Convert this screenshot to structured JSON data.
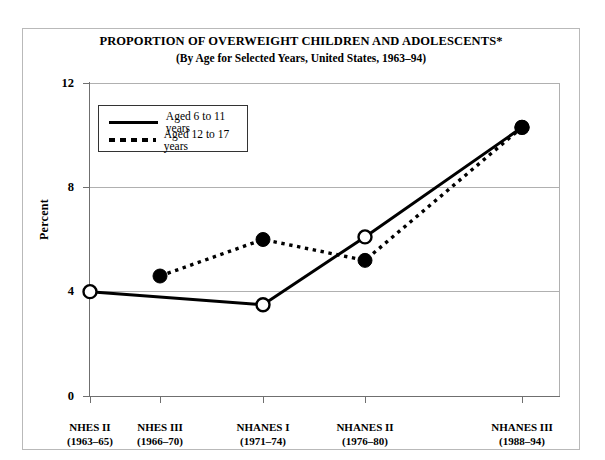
{
  "title": {
    "main": "PROPORTION OF OVERWEIGHT CHILDREN AND ADOLESCENTS*",
    "sub": "(By Age for Selected Years, United States, 1963–94)"
  },
  "axes": {
    "ylabel": "Percent",
    "yticks": [
      "0",
      "4",
      "8",
      "12"
    ],
    "xticklabels": [
      {
        "name": "NHES II",
        "years": "(1963–65)"
      },
      {
        "name": "NHES III",
        "years": "(1966–70)"
      },
      {
        "name": "NHANES I",
        "years": "(1971–74)"
      },
      {
        "name": "NHANES II",
        "years": "(1976–80)"
      },
      {
        "name": "NHANES III",
        "years": "(1988–94)"
      }
    ]
  },
  "legend": {
    "items": [
      {
        "label": "Aged 6 to 11 years",
        "style": "solid"
      },
      {
        "label": "Aged 12 to 17 years",
        "style": "dotted"
      }
    ]
  },
  "chart_data": {
    "type": "line",
    "title": "PROPORTION OF OVERWEIGHT CHILDREN AND ADOLESCENTS*",
    "subtitle": "(By Age for Selected Years, United States, 1963–94)",
    "xlabel": "",
    "ylabel": "Percent",
    "ylim": [
      0,
      12
    ],
    "yticks": [
      0,
      4,
      8,
      12
    ],
    "grid": true,
    "legend_position": "upper-left-inside",
    "categories": [
      "NHES II (1963–65)",
      "NHES III (1966–70)",
      "NHANES I (1971–74)",
      "NHANES II (1976–80)",
      "NHANES III (1988–94)"
    ],
    "series": [
      {
        "name": "Aged 6 to 11 years",
        "style": "solid",
        "marker": "open-circle",
        "x": [
          "NHES II (1963–65)",
          "NHANES I (1971–74)",
          "NHANES II (1976–80)",
          "NHANES III (1988–94)"
        ],
        "values": [
          4.0,
          3.5,
          6.1,
          10.3
        ]
      },
      {
        "name": "Aged 12 to 17 years",
        "style": "dotted",
        "marker": "filled-circle",
        "x": [
          "NHES III (1966–70)",
          "NHANES I (1971–74)",
          "NHANES II (1976–80)",
          "NHANES III (1988–94)"
        ],
        "values": [
          4.6,
          6.0,
          5.2,
          10.3
        ]
      }
    ]
  }
}
